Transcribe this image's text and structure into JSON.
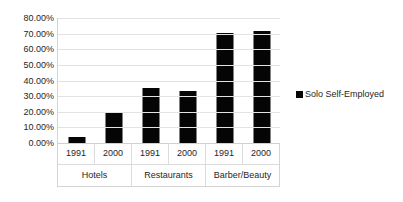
{
  "chart_data": {
    "type": "bar",
    "title": "",
    "xlabel": "",
    "ylabel": "",
    "ylim": [
      0,
      80
    ],
    "grid": true,
    "legend_position": "right",
    "categories": [
      "1991",
      "2000",
      "1991",
      "2000",
      "1991",
      "2000"
    ],
    "groups": [
      {
        "label": "Hotels",
        "span": 2
      },
      {
        "label": "Restaurants",
        "span": 2
      },
      {
        "label": "Barber/Beauty",
        "span": 2
      }
    ],
    "series": [
      {
        "name": "Solo Self-Employed",
        "color": "#050505",
        "values": [
          4.0,
          19.5,
          35.5,
          33.5,
          70.5,
          71.5
        ]
      }
    ],
    "y_ticks": [
      {
        "value": 80,
        "label": "80.00%"
      },
      {
        "value": 70,
        "label": "70.00%"
      },
      {
        "value": 60,
        "label": "60.00%"
      },
      {
        "value": 50,
        "label": "50.00%"
      },
      {
        "value": 40,
        "label": "40.00%"
      },
      {
        "value": 30,
        "label": "30.00%"
      },
      {
        "value": 20,
        "label": "20.00%"
      },
      {
        "value": 10,
        "label": "10.00%"
      },
      {
        "value": 0,
        "label": "0.00%"
      }
    ]
  },
  "legend": {
    "entries": [
      {
        "label": "Solo Self-Employed",
        "marker": "square-marker",
        "color": "#050505"
      }
    ]
  }
}
